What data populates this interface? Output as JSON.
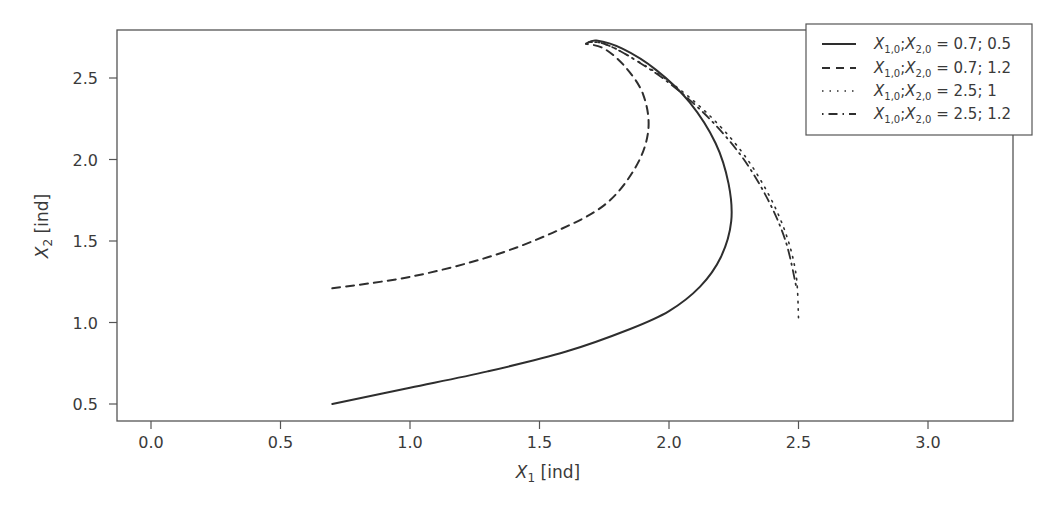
{
  "chart_data": {
    "type": "line",
    "title": "",
    "xlabel": "X1 [ind]",
    "ylabel": "X2 [ind]",
    "xlim": [
      -0.13,
      3.35
    ],
    "ylim": [
      0.43,
      2.83
    ],
    "grid": false,
    "legend_position": "upper right",
    "x_ticks": [
      "0.0",
      "0.5",
      "1.0",
      "1.5",
      "2.0",
      "2.5",
      "3.0"
    ],
    "y_ticks": [
      "0.5",
      "1.0",
      "1.5",
      "2.0",
      "2.5"
    ],
    "series": [
      {
        "name": "X1,0; X2,0 = 0.7; 0.5",
        "style": "solid",
        "x": [
          0.7,
          1.0,
          1.3,
          1.6,
          1.85,
          2.0,
          2.12,
          2.2,
          2.24,
          2.23,
          2.18,
          2.08,
          1.95,
          1.82,
          1.72,
          1.68
        ],
        "y": [
          0.5,
          0.6,
          0.7,
          0.82,
          0.96,
          1.07,
          1.22,
          1.4,
          1.62,
          1.85,
          2.1,
          2.35,
          2.55,
          2.68,
          2.73,
          2.71
        ]
      },
      {
        "name": "X1,0; X2,0 = 0.7; 1.2",
        "style": "dashed",
        "x": [
          0.7,
          1.0,
          1.3,
          1.55,
          1.75,
          1.87,
          1.92,
          1.9,
          1.83,
          1.75,
          1.68
        ],
        "y": [
          1.21,
          1.28,
          1.4,
          1.55,
          1.72,
          1.95,
          2.18,
          2.4,
          2.57,
          2.68,
          2.71
        ]
      },
      {
        "name": "X1,0; X2,0 = 2.5; 1",
        "style": "dotted",
        "x": [
          2.5,
          2.49,
          2.45,
          2.38,
          2.28,
          2.15,
          2.0,
          1.85,
          1.75,
          1.69
        ],
        "y": [
          1.03,
          1.3,
          1.55,
          1.8,
          2.05,
          2.28,
          2.48,
          2.63,
          2.71,
          2.72
        ]
      },
      {
        "name": "X1,0; X2,0 = 2.5; 1.2",
        "style": "dashdot",
        "x": [
          2.49,
          2.45,
          2.38,
          2.28,
          2.15,
          2.0,
          1.85,
          1.75,
          1.69
        ],
        "y": [
          1.23,
          1.5,
          1.76,
          2.02,
          2.26,
          2.47,
          2.63,
          2.71,
          2.72
        ]
      }
    ]
  },
  "legend": {
    "items": [
      {
        "lhs_a": "X",
        "sub_a": "1,0",
        "sep": ";",
        "lhs_b": "X",
        "sub_b": "2,0",
        "rhs": " = 0.7; 0.5"
      },
      {
        "lhs_a": "X",
        "sub_a": "1,0",
        "sep": ";",
        "lhs_b": "X",
        "sub_b": "2,0",
        "rhs": " = 0.7; 1.2"
      },
      {
        "lhs_a": "X",
        "sub_a": "1,0",
        "sep": ";",
        "lhs_b": "X",
        "sub_b": "2,0",
        "rhs": " = 2.5; 1"
      },
      {
        "lhs_a": "X",
        "sub_a": "1,0",
        "sep": ";",
        "lhs_b": "X",
        "sub_b": "2,0",
        "rhs": " = 2.5; 1.2"
      }
    ]
  },
  "axes": {
    "x_title": {
      "var": "X",
      "sub": "1",
      "unit": " [ind]"
    },
    "y_title": {
      "var": "X",
      "sub": "2",
      "unit": " [ind]"
    }
  },
  "colors": {
    "line": "#2e2e2e",
    "axis": "#555555"
  }
}
